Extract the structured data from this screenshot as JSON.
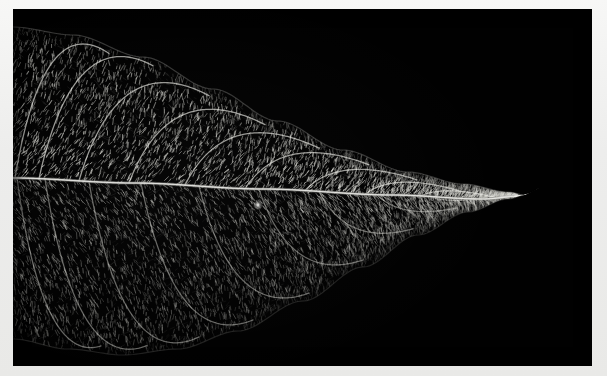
{
  "image": {
    "subject": "leaf-skeleton-venation",
    "capture_mode": "dark-field",
    "canvas_width": 607,
    "canvas_height": 376,
    "border": {
      "color": "#efefee",
      "left": 13,
      "top": 9,
      "right": 15,
      "bottom": 10
    },
    "photo": {
      "x": 13,
      "y": 9,
      "width": 579,
      "height": 357,
      "background_color": "#010101",
      "vein_color": "#d8d8d4",
      "mesh_color": "#8d8d88"
    },
    "alt_text": "Dark-field photograph of a cleared leaf skeleton showing the reticulate venation network in white against a black background",
    "caption": ""
  },
  "chart_data": {
    "type": "scatter",
    "xlabel": "",
    "ylabel": "",
    "xlim": [
      0,
      579
    ],
    "ylim": [
      0,
      357
    ],
    "grid": false,
    "legend": "none",
    "annotations": [
      {
        "label": "apex-hook",
        "x": 518,
        "y": 182
      },
      {
        "label": "bright-speck",
        "x": 245,
        "y": 196
      }
    ],
    "midrib": {
      "label": "midrib",
      "points": [
        [
          0,
          169
        ],
        [
          120,
          174
        ],
        [
          250,
          180
        ],
        [
          380,
          186
        ],
        [
          470,
          190
        ],
        [
          508,
          187
        ]
      ],
      "width_px": 2.0,
      "brightness": 0.95
    },
    "margin_upper": {
      "label": "upper-leaf-margin",
      "points": [
        [
          0,
          18
        ],
        [
          60,
          26
        ],
        [
          130,
          48
        ],
        [
          200,
          80
        ],
        [
          265,
          112
        ],
        [
          330,
          141
        ],
        [
          395,
          163
        ],
        [
          450,
          175
        ],
        [
          495,
          183
        ],
        [
          512,
          186
        ]
      ]
    },
    "margin_lower": {
      "label": "lower-leaf-margin",
      "points": [
        [
          0,
          330
        ],
        [
          55,
          340
        ],
        [
          110,
          346
        ],
        [
          165,
          340
        ],
        [
          225,
          322
        ],
        [
          290,
          292
        ],
        [
          350,
          258
        ],
        [
          405,
          226
        ],
        [
          455,
          203
        ],
        [
          495,
          190
        ],
        [
          512,
          186
        ]
      ]
    },
    "secondary_veins_upper": [
      {
        "name": "S-U1",
        "origin_x": 2,
        "reach_x": 96,
        "apex_y": 30
      },
      {
        "name": "S-U2",
        "origin_x": 26,
        "reach_x": 140,
        "apex_y": 42
      },
      {
        "name": "S-U3",
        "origin_x": 66,
        "reach_x": 196,
        "apex_y": 62
      },
      {
        "name": "S-U4",
        "origin_x": 116,
        "reach_x": 252,
        "apex_y": 86
      },
      {
        "name": "S-U5",
        "origin_x": 172,
        "reach_x": 306,
        "apex_y": 110
      },
      {
        "name": "S-U6",
        "origin_x": 232,
        "reach_x": 356,
        "apex_y": 133
      },
      {
        "name": "S-U7",
        "origin_x": 292,
        "reach_x": 404,
        "apex_y": 152
      },
      {
        "name": "S-U8",
        "origin_x": 352,
        "reach_x": 446,
        "apex_y": 167
      },
      {
        "name": "S-U9",
        "origin_x": 408,
        "reach_x": 482,
        "apex_y": 178
      }
    ],
    "secondary_veins_lower": [
      {
        "name": "S-L1",
        "origin_x": 4,
        "reach_x": 88,
        "apex_y": 322
      },
      {
        "name": "S-L2",
        "origin_x": 32,
        "reach_x": 134,
        "apex_y": 330
      },
      {
        "name": "S-L3",
        "origin_x": 76,
        "reach_x": 186,
        "apex_y": 330
      },
      {
        "name": "S-L4",
        "origin_x": 128,
        "reach_x": 240,
        "apex_y": 312
      },
      {
        "name": "S-L5",
        "origin_x": 186,
        "reach_x": 296,
        "apex_y": 288
      },
      {
        "name": "S-L6",
        "origin_x": 246,
        "reach_x": 350,
        "apex_y": 258
      },
      {
        "name": "S-L7",
        "origin_x": 306,
        "reach_x": 400,
        "apex_y": 228
      },
      {
        "name": "S-L8",
        "origin_x": 364,
        "reach_x": 444,
        "apex_y": 206
      },
      {
        "name": "S-L9",
        "origin_x": 418,
        "reach_x": 480,
        "apex_y": 194
      }
    ],
    "mesh": {
      "label": "areole-reticulum",
      "cell_count_estimate": 9000,
      "cell_length_px": [
        2,
        6
      ],
      "upper_half_brightness": 0.62,
      "lower_half_brightness": 0.42
    }
  }
}
